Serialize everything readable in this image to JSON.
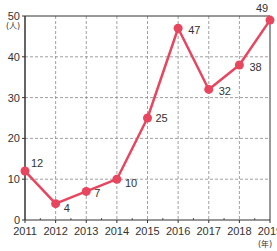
{
  "chart_data": {
    "type": "line",
    "title": "",
    "xlabel": "(年)",
    "ylabel": "(人)",
    "x": [
      "2011",
      "2012",
      "2013",
      "2014",
      "2015",
      "2016",
      "2017",
      "2018",
      "2019"
    ],
    "series": [
      {
        "name": "",
        "values": [
          12,
          4,
          7,
          10,
          25,
          47,
          32,
          38,
          49
        ],
        "color": "#e8455f"
      }
    ],
    "ylim": [
      0,
      50
    ],
    "yticks": [
      0,
      10,
      20,
      30,
      40,
      50
    ],
    "grid": true,
    "grid_style": "dashed",
    "legend": "none",
    "data_labels": true
  },
  "colors": {
    "line": "#e8455f",
    "axis": "#333333",
    "grid": "#888888"
  }
}
